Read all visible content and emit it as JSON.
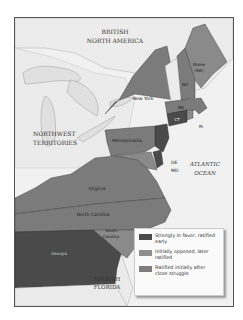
{
  "map": {
    "regions": {
      "british_north_america": "BRITISH\nNORTH AMERICA",
      "northwest_territories": "NORTHWEST\nTERRITORIES",
      "atlantic_ocean": "ATLANTIC\nOCEAN",
      "spanish_florida": "SPANISH\nFLORIDA"
    },
    "lakes": [
      "Lake Superior",
      "Lake Michigan",
      "Lake Huron",
      "Lake Ontario",
      "Lake Erie"
    ],
    "states": [
      {
        "name": "Maine (MA)",
        "category": "later"
      },
      {
        "name": "NH",
        "category": "struggle"
      },
      {
        "name": "MA",
        "category": "struggle"
      },
      {
        "name": "CT",
        "category": "early"
      },
      {
        "name": "RI",
        "category": "later"
      },
      {
        "name": "New York",
        "category": "struggle"
      },
      {
        "name": "Pennsylvania",
        "category": "early"
      },
      {
        "name": "NJ",
        "category": "early"
      },
      {
        "name": "DE",
        "category": "early"
      },
      {
        "name": "MD",
        "category": "later"
      },
      {
        "name": "Virginia",
        "category": "struggle"
      },
      {
        "name": "North Carolina",
        "category": "later"
      },
      {
        "name": "South Carolina",
        "category": "later"
      },
      {
        "name": "Georgia",
        "category": "early"
      }
    ],
    "labels": {
      "maine": "Maine",
      "maine2": "(MA)",
      "nh": "NH",
      "ma": "MA",
      "ct": "CT",
      "ri": "RI",
      "new_york": "New York",
      "pennsylvania": "Pennsylvania",
      "de": "DE",
      "md": "MD",
      "virginia": "Virginia",
      "north_carolina": "North Carolina",
      "south_carolina1": "South",
      "south_carolina2": "Carolina",
      "georgia": "Georgia",
      "bna1": "BRITISH",
      "bna2": "NORTH AMERICA",
      "nwt1": "NORTHWEST",
      "nwt2": "TERRITORIES",
      "ocean1": "ATLANTIC",
      "ocean2": "OCEAN",
      "fl1": "SPANISH",
      "fl2": "FLORIDA"
    }
  },
  "colors": {
    "early": "#4a4a4a",
    "later": "#8a8a8a",
    "struggle": "#7b7b7b",
    "water": "#f1f1f1",
    "land": "#e4e4e4"
  },
  "legend": {
    "items": [
      {
        "label": "Strongly in favor, ratified early",
        "color": "#4a4a4a"
      },
      {
        "label": "Initially opposed, later ratified",
        "color": "#8e8e8e"
      },
      {
        "label": "Ratified initially after close struggle",
        "color": "#7d7d7d"
      }
    ]
  }
}
